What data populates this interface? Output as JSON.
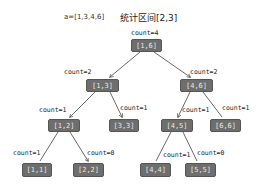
{
  "header": {
    "array_label": "a=[1,3,4,6]",
    "query_label": "统计区间[2,3]"
  },
  "tree": {
    "root": {
      "range": "[1,6]",
      "count": "count=4"
    },
    "n13": {
      "range": "[1,3]",
      "count": "count=2"
    },
    "n46": {
      "range": "[4,6]",
      "count": "count=2"
    },
    "n12": {
      "range": "[1,2]",
      "count": "count=1"
    },
    "n33": {
      "range": "[3,3]",
      "count": "count=1"
    },
    "n45": {
      "range": "[4,5]",
      "count": "count=1"
    },
    "n66": {
      "range": "[6,6]",
      "count": "count=1"
    },
    "n11": {
      "range": "[1,1]",
      "count": "count=1"
    },
    "n22": {
      "range": "[2,2]",
      "count": "count=0"
    },
    "n44": {
      "range": "[4,4]",
      "count": "count=1"
    },
    "n55": {
      "range": "[5,5]",
      "count": "count=0"
    }
  },
  "colors": {
    "node_fill": "#6e6e6e",
    "node_text": "#e8e8e8",
    "edge": "#444444"
  }
}
